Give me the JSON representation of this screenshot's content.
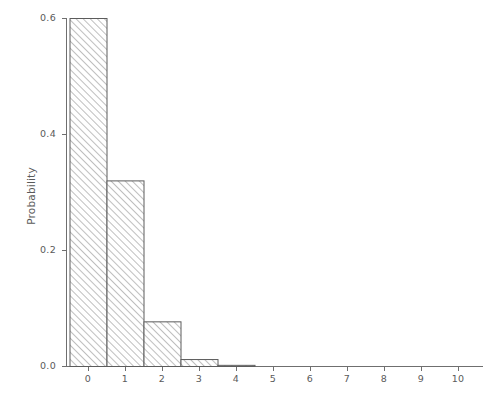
{
  "chart_data": {
    "type": "bar",
    "title": "",
    "subtitle": "",
    "xlabel": "",
    "ylabel": "Probability",
    "categories": [
      "0",
      "1",
      "2",
      "3",
      "4",
      "5",
      "6",
      "7",
      "8",
      "9",
      "10"
    ],
    "values": [
      0.6,
      0.32,
      0.077,
      0.012,
      0.002,
      0.0,
      0.0,
      0.0,
      0.0,
      0.0,
      0.0
    ],
    "xlim": [
      -0.8,
      10.8
    ],
    "ylim": [
      0.0,
      0.6
    ],
    "x_ticks": [
      "0",
      "1",
      "2",
      "3",
      "4",
      "5",
      "6",
      "7",
      "8",
      "9",
      "10"
    ],
    "x_tick_values": [
      0,
      1,
      2,
      3,
      4,
      5,
      6,
      7,
      8,
      9,
      10
    ],
    "y_ticks": [
      "0.0",
      "0.2",
      "0.4",
      "0.6"
    ],
    "y_tick_values": [
      0.0,
      0.2,
      0.4,
      0.6
    ],
    "grid": false,
    "legend": null,
    "bar_width": 1.0,
    "bar_fill": "hatched-diagonal",
    "bar_edge_color": "#5c5c5c",
    "axis_color": "#6f6f6f",
    "background": "#ffffff"
  }
}
